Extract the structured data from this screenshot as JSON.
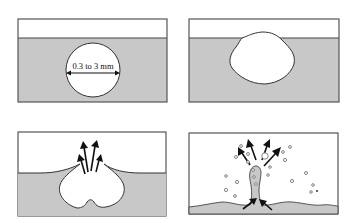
{
  "diagram": {
    "colors": {
      "liquid": "#c8c8c8",
      "air": "#ffffff",
      "outline": "#333333",
      "arrow": "#111111"
    },
    "panels": [
      {
        "id": 1,
        "position": "top-left",
        "description": "Spherical bubble submerged below liquid surface",
        "label": "0.3 to 3 mm",
        "dimension_arrow": "double-headed horizontal diameter arrow"
      },
      {
        "id": 2,
        "position": "top-right",
        "description": "Bubble rises to surface, forming a thin film cap"
      },
      {
        "id": 3,
        "position": "bottom-left",
        "description": "Film cap ruptures, releasing film drops upward",
        "arrows": 4,
        "arrow_direction": "upward"
      },
      {
        "id": 4,
        "position": "bottom-right",
        "description": "Cavity collapses into an upward jet that breaks into jet drops",
        "arrows_up": 4,
        "arrows_inward": 2,
        "droplets": "scattered small drops"
      }
    ]
  }
}
